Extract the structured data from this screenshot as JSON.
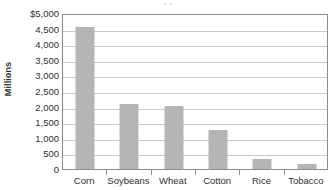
{
  "chart_data": {
    "type": "bar",
    "title": "",
    "title_remnant": "• •",
    "xlabel": "",
    "ylabel": "Millions",
    "categories": [
      "Corn",
      "Soybeans",
      "Wheat",
      "Cotton",
      "Rice",
      "Tobacco"
    ],
    "values": [
      4550,
      2070,
      2010,
      1250,
      330,
      150
    ],
    "ylim": [
      0,
      5000
    ],
    "ytick_values": [
      5000,
      4500,
      4000,
      3500,
      3000,
      2500,
      2000,
      1500,
      1000,
      500,
      0
    ],
    "ytick_labels": [
      "$5,000",
      "4,500",
      "4,000",
      "3,500",
      "3,000",
      "2,500",
      "2,000",
      "1,500",
      "1,000",
      "500",
      "0"
    ],
    "grid": true,
    "grid_axis": "y",
    "legend": "none",
    "bar_color": "#b5b5b5",
    "plot_border_color": "#8c8c8c",
    "gridline_color": "#c9c9c9",
    "background_color": "#ffffff",
    "currency_symbol": "$",
    "units": "Millions"
  }
}
